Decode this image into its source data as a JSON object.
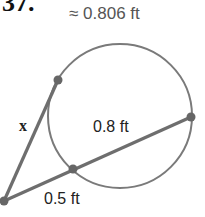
{
  "problem": {
    "number": "37."
  },
  "answer": {
    "text": "≈ 0.806 ft"
  },
  "diagram": {
    "type": "tangent-secant circle",
    "labels": {
      "tangent": "x",
      "external_secant": "0.5 ft",
      "internal_secant": "0.8 ft"
    },
    "colors": {
      "stroke": "#777777",
      "point": "#666666"
    }
  }
}
